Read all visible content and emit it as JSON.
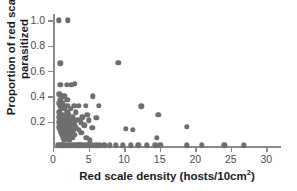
{
  "chart_data": {
    "type": "scatter",
    "title": "",
    "xlabel": "Red scale density (hosts/10cm2)",
    "xlabel_main": "Red scale density (hosts/10cm",
    "xlabel_sup": "2",
    "xlabel_tail": ")",
    "ylabel_line1": "Proportion of red scales",
    "ylabel_line2": "parasitized",
    "xlim": [
      0,
      31.5
    ],
    "ylim": [
      0,
      1.05
    ],
    "xticks": [
      0,
      5,
      10,
      15,
      20,
      25,
      30
    ],
    "xtick_labels": [
      "0",
      "5",
      "10",
      "15",
      "20",
      "25",
      "30"
    ],
    "yticks": [
      0.2,
      0.4,
      0.6,
      0.8,
      1.0
    ],
    "ytick_labels": [
      "0.2",
      "0.4",
      "0.6",
      "0.8",
      "1.0"
    ],
    "grid": false,
    "legend": "none",
    "marker": "filled-circle",
    "marker_color": "#6e6e6e",
    "axis_color": "#8a8a8a",
    "points": [
      [
        0.8,
        1.0
      ],
      [
        2.1,
        1.0
      ],
      [
        1.0,
        0.66
      ],
      [
        9.2,
        0.665
      ],
      [
        1.0,
        0.49
      ],
      [
        1.9,
        0.49
      ],
      [
        2.6,
        0.49
      ],
      [
        3.1,
        0.5
      ],
      [
        0.9,
        0.415
      ],
      [
        1.2,
        0.4
      ],
      [
        1.6,
        0.4
      ],
      [
        5.6,
        0.4
      ],
      [
        1.0,
        0.375
      ],
      [
        2.0,
        0.375
      ],
      [
        0.9,
        0.345
      ],
      [
        1.4,
        0.345
      ],
      [
        1.0,
        0.325
      ],
      [
        1.5,
        0.325
      ],
      [
        2.0,
        0.325
      ],
      [
        3.0,
        0.325
      ],
      [
        3.6,
        0.325
      ],
      [
        4.6,
        0.325
      ],
      [
        6.4,
        0.325
      ],
      [
        12.4,
        0.322
      ],
      [
        1.1,
        0.3
      ],
      [
        1.7,
        0.3
      ],
      [
        2.5,
        0.3
      ],
      [
        0.9,
        0.275
      ],
      [
        2.0,
        0.275
      ],
      [
        3.2,
        0.275
      ],
      [
        1.0,
        0.255
      ],
      [
        1.4,
        0.255
      ],
      [
        2.2,
        0.255
      ],
      [
        4.8,
        0.252
      ],
      [
        14.8,
        0.252
      ],
      [
        0.9,
        0.235
      ],
      [
        1.3,
        0.235
      ],
      [
        2.0,
        0.235
      ],
      [
        2.8,
        0.235
      ],
      [
        4.1,
        0.235
      ],
      [
        6.1,
        0.232
      ],
      [
        1.0,
        0.215
      ],
      [
        1.6,
        0.215
      ],
      [
        2.4,
        0.215
      ],
      [
        3.4,
        0.215
      ],
      [
        5.0,
        0.212
      ],
      [
        0.9,
        0.195
      ],
      [
        1.2,
        0.195
      ],
      [
        1.8,
        0.195
      ],
      [
        2.2,
        0.195
      ],
      [
        3.0,
        0.195
      ],
      [
        3.9,
        0.195
      ],
      [
        1.0,
        0.175
      ],
      [
        1.5,
        0.175
      ],
      [
        2.1,
        0.175
      ],
      [
        2.6,
        0.175
      ],
      [
        4.4,
        0.172
      ],
      [
        0.9,
        0.155
      ],
      [
        1.3,
        0.155
      ],
      [
        1.9,
        0.155
      ],
      [
        2.5,
        0.155
      ],
      [
        3.2,
        0.155
      ],
      [
        5.5,
        0.152
      ],
      [
        10.2,
        0.142
      ],
      [
        11.2,
        0.137
      ],
      [
        18.8,
        0.158
      ],
      [
        1.0,
        0.135
      ],
      [
        1.7,
        0.135
      ],
      [
        2.3,
        0.135
      ],
      [
        2.9,
        0.135
      ],
      [
        3.6,
        0.135
      ],
      [
        1.1,
        0.115
      ],
      [
        1.5,
        0.115
      ],
      [
        2.0,
        0.115
      ],
      [
        2.7,
        0.115
      ],
      [
        4.0,
        0.112
      ],
      [
        1.2,
        0.095
      ],
      [
        1.8,
        0.095
      ],
      [
        2.4,
        0.095
      ],
      [
        3.1,
        0.095
      ],
      [
        1.4,
        0.075
      ],
      [
        2.1,
        0.075
      ],
      [
        2.8,
        0.075
      ],
      [
        4.7,
        0.073
      ],
      [
        14.6,
        0.072
      ],
      [
        1.6,
        0.055
      ],
      [
        2.3,
        0.055
      ],
      [
        5.2,
        0.052
      ],
      [
        0.7,
        0.012
      ],
      [
        1.0,
        0.012
      ],
      [
        1.3,
        0.012
      ],
      [
        1.6,
        0.012
      ],
      [
        1.9,
        0.012
      ],
      [
        2.2,
        0.012
      ],
      [
        2.5,
        0.012
      ],
      [
        2.8,
        0.012
      ],
      [
        3.1,
        0.012
      ],
      [
        3.4,
        0.012
      ],
      [
        3.7,
        0.012
      ],
      [
        4.0,
        0.012
      ],
      [
        4.4,
        0.012
      ],
      [
        4.8,
        0.012
      ],
      [
        5.2,
        0.012
      ],
      [
        5.6,
        0.012
      ],
      [
        6.1,
        0.012
      ],
      [
        6.6,
        0.012
      ],
      [
        7.2,
        0.012
      ],
      [
        8.0,
        0.012
      ],
      [
        8.8,
        0.012
      ],
      [
        9.8,
        0.012
      ],
      [
        10.9,
        0.012
      ],
      [
        12.0,
        0.012
      ],
      [
        13.2,
        0.012
      ],
      [
        14.4,
        0.012
      ],
      [
        15.1,
        0.012
      ],
      [
        18.8,
        0.012
      ],
      [
        20.9,
        0.012
      ],
      [
        24.1,
        0.012
      ],
      [
        26.8,
        0.012
      ]
    ]
  }
}
